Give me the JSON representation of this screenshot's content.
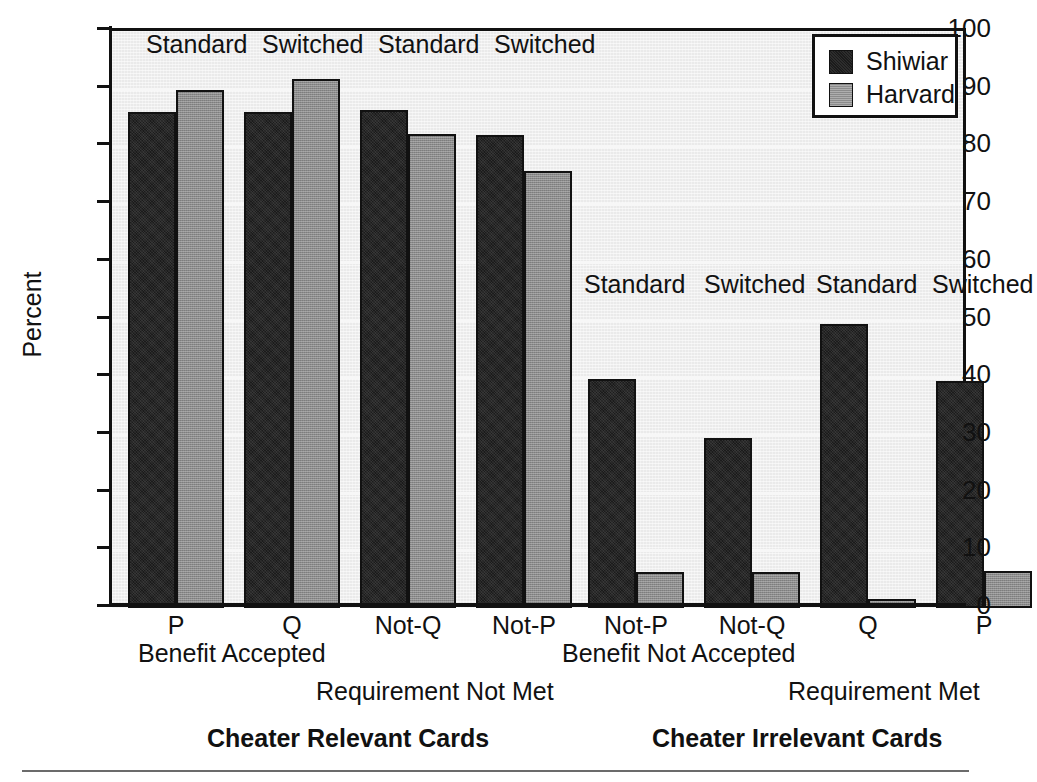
{
  "chart_data": {
    "type": "bar",
    "title": "",
    "xlabel": "",
    "ylabel": "Percent",
    "ylim": [
      0,
      100
    ],
    "ytick_step": 10,
    "yticks": [
      100,
      90,
      80,
      70,
      60,
      50,
      40,
      30,
      20,
      10,
      0
    ],
    "grid": true,
    "legend": {
      "position": "top-right",
      "entries": [
        {
          "name": "Shiwiar",
          "color": "#1b1b1b"
        },
        {
          "name": "Harvard",
          "color": "#8b8b8b"
        }
      ]
    },
    "panels": [
      {
        "title": "Cheater Relevant Cards",
        "groups": [
          {
            "card": "P",
            "version": "Standard",
            "group": "Benefit Accepted",
            "Shiwiar": 86.0,
            "Harvard": 89.7
          },
          {
            "card": "Q",
            "version": "Switched",
            "group": "Benefit Accepted",
            "Shiwiar": 86.0,
            "Harvard": 91.7
          },
          {
            "card": "Not-Q",
            "version": "Standard",
            "group": "Requirement Not Met",
            "Shiwiar": 86.3,
            "Harvard": 82.2
          },
          {
            "card": "Not-P",
            "version": "Switched",
            "group": "Requirement Not Met",
            "Shiwiar": 82.0,
            "Harvard": 75.7
          }
        ]
      },
      {
        "title": "Cheater Irrelevant Cards",
        "groups": [
          {
            "card": "Not-P",
            "version": "Standard",
            "group": "Benefit Not Accepted",
            "Shiwiar": 39.7,
            "Harvard": 6.2
          },
          {
            "card": "Not-Q",
            "version": "Switched",
            "group": "Benefit Not Accepted",
            "Shiwiar": 29.5,
            "Harvard": 6.2
          },
          {
            "card": "Q",
            "version": "Standard",
            "group": "Requirement Met",
            "Shiwiar": 49.3,
            "Harvard": 1.5
          },
          {
            "card": "P",
            "version": "Switched",
            "group": "Requirement Met",
            "Shiwiar": 39.3,
            "Harvard": 6.5
          }
        ]
      }
    ],
    "series": [
      {
        "name": "Shiwiar",
        "values": [
          86.0,
          86.0,
          86.3,
          82.0,
          39.7,
          29.5,
          49.3,
          39.3
        ]
      },
      {
        "name": "Harvard",
        "values": [
          89.7,
          91.7,
          82.2,
          75.7,
          6.2,
          6.2,
          1.5,
          6.5
        ]
      }
    ],
    "categories": [
      "P",
      "Q",
      "Not-Q",
      "Not-P",
      "Not-P",
      "Not-Q",
      "Q",
      "P"
    ]
  },
  "axis": {
    "y_title": "Percent",
    "y_labels": [
      "100",
      "90",
      "80",
      "70",
      "60",
      "50",
      "40",
      "30",
      "20",
      "10",
      "0"
    ]
  },
  "legend": {
    "items": [
      {
        "label": "Shiwiar"
      },
      {
        "label": "Harvard"
      }
    ]
  },
  "conditions": {
    "left": [
      "Standard",
      "Switched",
      "Standard",
      "Switched"
    ],
    "right": [
      "Standard",
      "Switched",
      "Standard",
      "Switched"
    ]
  },
  "xticks": [
    "P",
    "Q",
    "Not-Q",
    "Not-P",
    "Not-P",
    "Not-Q",
    "Q",
    "P"
  ],
  "group_labels": {
    "benefit_accepted": "Benefit Accepted",
    "requirement_not_met": "Requirement Not Met",
    "benefit_not_accepted": "Benefit Not Accepted",
    "requirement_met": "Requirement Met"
  },
  "panel_titles": {
    "left": "Cheater Relevant Cards",
    "right": "Cheater Irrelevant Cards"
  }
}
